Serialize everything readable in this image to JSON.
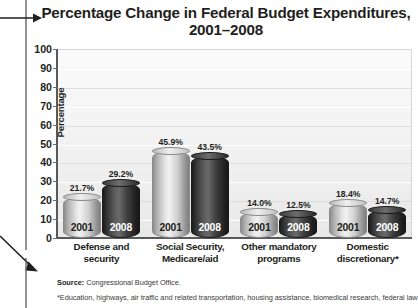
{
  "chart_data": {
    "type": "bar",
    "title": "Percentage Change in Federal Budget Expenditures, 2001–2008",
    "title_line1": "Percentage Change in Federal Budget Expenditures,",
    "title_line2": "2001–2008",
    "xlabel": "",
    "ylabel": "Percentage",
    "ylim": [
      0,
      100
    ],
    "yticks": [
      100,
      90,
      80,
      70,
      60,
      50,
      40,
      30,
      20,
      10,
      0
    ],
    "grid": true,
    "legend": "none",
    "categories": [
      "Defense and security",
      "Social Security, Medicare/aid",
      "Other mandatory programs",
      "Domestic discretionary*"
    ],
    "category_lines": [
      [
        "Defense and",
        "security"
      ],
      [
        "Social Security,",
        "Medicare/aid"
      ],
      [
        "Other mandatory",
        "programs"
      ],
      [
        "Domestic",
        "discretionary*"
      ]
    ],
    "series": [
      {
        "name": "2001",
        "values": [
          21.7,
          45.9,
          14.0,
          18.4
        ],
        "labels": [
          "21.7%",
          "45.9%",
          "14.0%",
          "18.4%"
        ],
        "style": "light"
      },
      {
        "name": "2008",
        "values": [
          29.2,
          43.5,
          12.5,
          14.7
        ],
        "labels": [
          "29.2%",
          "43.5%",
          "12.5%",
          "14.7%"
        ],
        "style": "dark"
      }
    ]
  },
  "notes": {
    "source_label": "Source:",
    "source_text": " Congressional Budget Office.",
    "footnote": "*Education, highways, air traffic and related transportation, housing assistance, biomedical research, federal law"
  },
  "annotations": {
    "title_arrow": "arrow-right-icon",
    "source_arrow": "arrow-down-right-icon"
  },
  "colors": {
    "text": "#231f20",
    "axis": "#58595b",
    "bar_light": "#d8d8d8",
    "bar_dark": "#2a2a2a",
    "plot_background": "#f1f1f1"
  }
}
